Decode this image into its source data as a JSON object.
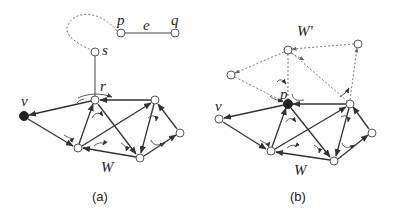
{
  "figure": {
    "panel_a": {
      "caption": "(a)",
      "labels": {
        "p": "p",
        "q": "q",
        "e": "e",
        "s": "s",
        "r": "r",
        "v": "v",
        "W": "W"
      },
      "nodes": [
        {
          "id": "p",
          "x": 121,
          "y": 33,
          "filled": false
        },
        {
          "id": "q",
          "x": 175,
          "y": 33,
          "filled": false
        },
        {
          "id": "s",
          "x": 95,
          "y": 52,
          "filled": false
        },
        {
          "id": "r",
          "x": 95,
          "y": 100,
          "filled": false
        },
        {
          "id": "v",
          "x": 24,
          "y": 116,
          "filled": true
        },
        {
          "id": "a1",
          "x": 155,
          "y": 100,
          "filled": false
        },
        {
          "id": "a2",
          "x": 78,
          "y": 148,
          "filled": false
        },
        {
          "id": "a3",
          "x": 140,
          "y": 158,
          "filled": false
        },
        {
          "id": "a4",
          "x": 180,
          "y": 133,
          "filled": false
        }
      ]
    },
    "panel_b": {
      "caption": "(b)",
      "labels": {
        "Wprime": "W'",
        "p": "p",
        "v": "v",
        "W": "W"
      },
      "nodes": [
        {
          "id": "w1",
          "x": 288,
          "y": 50,
          "filled": false
        },
        {
          "id": "w2",
          "x": 358,
          "y": 44,
          "filled": false
        },
        {
          "id": "w3",
          "x": 231,
          "y": 75,
          "filled": false
        },
        {
          "id": "p",
          "x": 288,
          "y": 104,
          "filled": true
        },
        {
          "id": "v",
          "x": 219,
          "y": 119,
          "filled": false
        },
        {
          "id": "b1",
          "x": 350,
          "y": 104,
          "filled": false
        },
        {
          "id": "b2",
          "x": 271,
          "y": 151,
          "filled": false
        },
        {
          "id": "b3",
          "x": 334,
          "y": 161,
          "filled": false
        },
        {
          "id": "b4",
          "x": 372,
          "y": 133,
          "filled": false
        }
      ]
    }
  }
}
